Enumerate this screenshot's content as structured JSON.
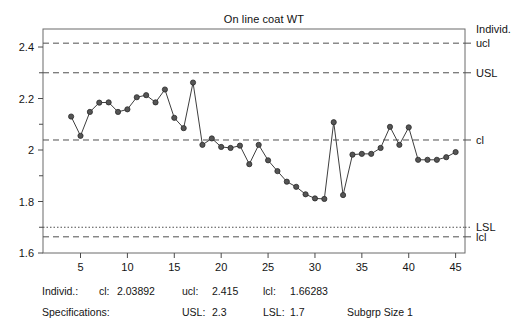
{
  "chart_data": {
    "type": "line",
    "title": "On line coat WT",
    "xlabel": "",
    "ylabel": "",
    "xlim": [
      1,
      46
    ],
    "ylim": [
      1.6,
      2.47
    ],
    "grid": false,
    "legend_position": "right-outside",
    "x_ticks": [
      5,
      10,
      15,
      20,
      25,
      30,
      35,
      40,
      45
    ],
    "y_ticks": [
      1.6,
      1.8,
      2.0,
      2.2,
      2.4
    ],
    "y_tick_labels": [
      "1.6",
      "1.8",
      "2",
      "2.2",
      "2.4"
    ],
    "y_minor_ticks": [
      1.7,
      1.9,
      2.1,
      2.3
    ],
    "series": [
      {
        "name": "Individ.",
        "marker": "filled-circle",
        "color": "#3f3f3f",
        "x": [
          4,
          5,
          6,
          7,
          8,
          9,
          10,
          11,
          12,
          13,
          14,
          15,
          16,
          17,
          18,
          19,
          20,
          21,
          22,
          23,
          24,
          25,
          26,
          27,
          28,
          29,
          30,
          31,
          32,
          33,
          34,
          35,
          36,
          37,
          38,
          39,
          40,
          41,
          42,
          43,
          44,
          45
        ],
        "values": [
          2.13,
          2.055,
          2.148,
          2.184,
          2.185,
          2.148,
          2.158,
          2.205,
          2.213,
          2.185,
          2.235,
          2.125,
          2.085,
          2.262,
          2.02,
          2.045,
          2.012,
          2.008,
          2.017,
          1.945,
          2.02,
          1.96,
          1.918,
          1.877,
          1.857,
          1.828,
          1.812,
          1.81,
          2.108,
          1.825,
          1.982,
          1.985,
          1.985,
          2.008,
          2.09,
          2.02,
          2.088,
          1.962,
          1.962,
          1.962,
          1.972,
          1.992
        ]
      }
    ],
    "reference_lines": [
      {
        "name": "ucl",
        "label": "ucl",
        "value": 2.415,
        "style": "dashed"
      },
      {
        "name": "USL",
        "label": "USL",
        "value": 2.3,
        "style": "dashed"
      },
      {
        "name": "cl",
        "label": "cl",
        "value": 2.03892,
        "style": "dashed"
      },
      {
        "name": "LSL",
        "label": "LSL",
        "value": 1.7,
        "style": "dotted"
      },
      {
        "name": "lcl",
        "label": "lcl",
        "value": 1.66283,
        "style": "dashed"
      }
    ],
    "series_axis_label": "Individ."
  },
  "footer": {
    "row1": {
      "label": "Individ.:",
      "cl_key": "cl:",
      "cl_value": "2.03892",
      "ucl_key": "ucl:",
      "ucl_value": "2.415",
      "lcl_key": "lcl:",
      "lcl_value": "1.66283"
    },
    "row2": {
      "label": "Specifications:",
      "usl_key": "USL:",
      "usl_value": "2.3",
      "lsl_key": "LSL:",
      "lsl_value": "1.7",
      "subgroup": "Subgrp Size 1"
    }
  }
}
